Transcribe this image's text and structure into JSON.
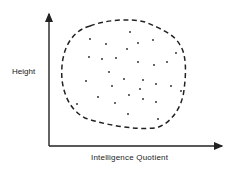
{
  "diagram": {
    "type": "scatter",
    "x_axis_label": "Intelligence Quotient",
    "y_axis_label": "Height",
    "boundary_style": "dashed closed curve enclosing points",
    "colors": {
      "ink": "#222222",
      "background": "#ffffff"
    }
  },
  "chart_data": {
    "type": "scatter",
    "title": "",
    "xlabel": "Intelligence Quotient",
    "ylabel": "Height",
    "grid": false,
    "legend": null,
    "annotations": [
      "dashed boundary enclosing scatter of points (no correlation)"
    ],
    "points_px": [
      [
        130,
        32
      ],
      [
        90,
        39
      ],
      [
        106,
        44
      ],
      [
        138,
        43
      ],
      [
        153,
        40
      ],
      [
        127,
        49
      ],
      [
        176,
        53
      ],
      [
        89,
        57
      ],
      [
        102,
        59
      ],
      [
        116,
        58
      ],
      [
        138,
        62
      ],
      [
        154,
        65
      ],
      [
        167,
        62
      ],
      [
        109,
        72
      ],
      [
        86,
        81
      ],
      [
        124,
        79
      ],
      [
        143,
        80
      ],
      [
        112,
        86
      ],
      [
        140,
        89
      ],
      [
        156,
        84
      ],
      [
        171,
        86
      ],
      [
        181,
        91
      ],
      [
        98,
        97
      ],
      [
        129,
        95
      ],
      [
        143,
        99
      ],
      [
        156,
        102
      ],
      [
        115,
        103
      ],
      [
        77,
        104
      ],
      [
        128,
        114
      ],
      [
        158,
        119
      ]
    ]
  }
}
